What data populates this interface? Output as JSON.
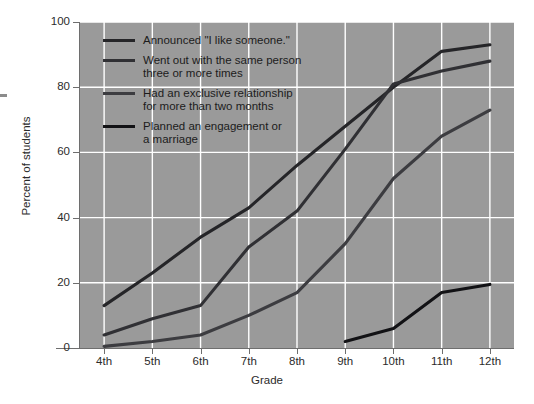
{
  "chart_data": {
    "type": "line",
    "title": "",
    "xlabel": "Grade",
    "ylabel": "Percent of students",
    "categories": [
      "4th",
      "5th",
      "6th",
      "7th",
      "8th",
      "9th",
      "10th",
      "11th",
      "12th"
    ],
    "x_tick_labels": [
      "4th",
      "5th",
      "6th",
      "7th",
      "8th",
      "9th",
      "10th",
      "11th",
      "12th"
    ],
    "y_tick_labels": [
      "0",
      "20",
      "40",
      "60",
      "80",
      "100"
    ],
    "y_ticks": [
      0,
      20,
      40,
      60,
      80,
      100
    ],
    "ylim": [
      0,
      100
    ],
    "grid": true,
    "grid_color": "#ffffff",
    "plot_background": "#9a9a9a",
    "figure_background": "#ffffff",
    "legend_position": "upper-left-inside",
    "series": [
      {
        "name": "Announced \"I like someone.\"",
        "color": "#252528",
        "values": [
          13,
          23,
          34,
          43,
          56,
          68,
          80,
          91,
          93
        ]
      },
      {
        "name": "Went out with the same person three or more times",
        "color": "#303034",
        "values": [
          4,
          9,
          13,
          31,
          42,
          61,
          81,
          85,
          88
        ]
      },
      {
        "name": "Had an exclusive relationship for more than two months",
        "color": "#3c3c40",
        "values": [
          0.5,
          2,
          4,
          10,
          17,
          32,
          52,
          65,
          73
        ]
      },
      {
        "name": "Planned an engagement or a marriage",
        "color": "#121215",
        "values": [
          null,
          null,
          null,
          null,
          null,
          2,
          6,
          17,
          19.5
        ]
      }
    ]
  },
  "legend": {
    "items": [
      {
        "label": "Announced \"I like someone.\"",
        "color": "#252528"
      },
      {
        "label": "Went out with the same person\nthree or more times",
        "color": "#303034"
      },
      {
        "label": "Had an exclusive relationship\nfor more than two months",
        "color": "#3c3c40"
      },
      {
        "label": "Planned an engagement or\na marriage",
        "color": "#121215"
      }
    ]
  },
  "axes": {
    "x_title": "Grade",
    "y_title": "Percent of students"
  }
}
